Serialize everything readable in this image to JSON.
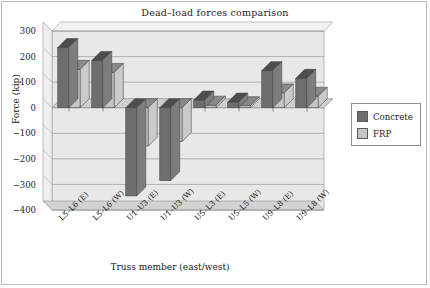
{
  "figure": {
    "title": "Dead–load forces comparison",
    "background": "#ffffff",
    "border_color": "#b9b9b9"
  },
  "legend": {
    "position": "right",
    "entries": [
      {
        "label": "Concrete",
        "color": "#6e6e6e"
      },
      {
        "label": "FRP",
        "color": "#c4c4c4"
      }
    ]
  },
  "axes": {
    "xlabel": "Truss member (east/west)",
    "ylabel": "Force (kip)",
    "yticks": [
      300,
      200,
      100,
      0,
      -100,
      -200,
      -300,
      -400
    ],
    "ytick_labels": [
      "300",
      "200",
      "100",
      "0",
      "−100",
      "−200",
      "−300",
      "−400"
    ],
    "ylim": [
      -400,
      300
    ],
    "grid": true,
    "wall_color": "#e6e6e6",
    "floor_color": "#d2d2d2",
    "grid_color": "#9a9a9a"
  },
  "chart_data": {
    "type": "bar",
    "title": "Dead–load forces comparison",
    "xlabel": "Truss member (east/west)",
    "ylabel": "Force (kip)",
    "ylim": [
      -400,
      300
    ],
    "grid": true,
    "legend_position": "right",
    "categories": [
      "L5–L6 (E)",
      "L5–L6 (W)",
      "U1–U3 (E)",
      "U1–U3 (W)",
      "U5–L3 (E)",
      "U5–L5 (W)",
      "U9–L8 (E)",
      "U9–L8 (W)"
    ],
    "series": [
      {
        "name": "Concrete",
        "color": "#6e6e6e",
        "values": [
          235,
          185,
          -345,
          -285,
          30,
          22,
          145,
          115
        ]
      },
      {
        "name": "FRP",
        "color": "#c4c4c4",
        "values": [
          150,
          138,
          -150,
          -132,
          10,
          8,
          58,
          45
        ]
      }
    ]
  }
}
